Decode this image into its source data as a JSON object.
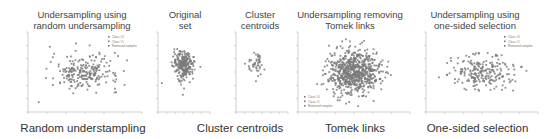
{
  "figure": {
    "panels": [
      {
        "id": "random",
        "title_line1": "Undersampling using",
        "title_line2": "random undersampling",
        "caption": "Random understampling"
      },
      {
        "id": "original",
        "title_line1": "Original",
        "title_line2": "set",
        "caption": ""
      },
      {
        "id": "centroids",
        "title_line1": "Cluster",
        "title_line2": "centroids",
        "caption": "Cluster centroids"
      },
      {
        "id": "tomek",
        "title_line1": "Undersampling removing",
        "title_line2": "Tomek links",
        "caption": "Tomek links"
      },
      {
        "id": "onesided",
        "title_line1": "Undersampling using",
        "title_line2": "one-sided selection",
        "caption": "One-sided selection"
      }
    ],
    "legend": [
      "Class #0",
      "Class #1",
      "Removed samples"
    ],
    "colors": {
      "points": "#7a7a7a",
      "axis": "#bbbbbb",
      "text": "#444444"
    }
  },
  "chart_data": [
    {
      "type": "scatter",
      "title": "Undersampling using random undersampling",
      "caption": "Random understampling",
      "legend": [
        "Class #0",
        "Class #1",
        "Removed samples"
      ],
      "legend_position": "upper right",
      "xlim": [
        -6,
        6
      ],
      "ylim": [
        -6,
        4
      ],
      "n_points_approx": 230,
      "center": [
        0,
        -1
      ],
      "spread": [
        3,
        1.2
      ]
    },
    {
      "type": "scatter",
      "title": "Original set",
      "xlim": [
        -3,
        3
      ],
      "ylim": [
        -6,
        4
      ],
      "n_points_approx": 250,
      "center": [
        0,
        -0.2
      ],
      "spread": [
        1,
        1
      ]
    },
    {
      "type": "scatter",
      "title": "Cluster centroids",
      "caption": "Cluster centroids",
      "xlim": [
        -3,
        3
      ],
      "ylim": [
        -6,
        4
      ],
      "n_points_approx": 45,
      "center": [
        -0.8,
        0
      ],
      "spread": [
        0.8,
        1
      ]
    },
    {
      "type": "scatter",
      "title": "Undersampling removing Tomek links",
      "caption": "Tomek links",
      "legend": [
        "Class #0",
        "Class #1",
        "Removed samples"
      ],
      "legend_position": "lower left",
      "xlim": [
        -8,
        8
      ],
      "ylim": [
        -6,
        6
      ],
      "n_points_approx": 700,
      "center": [
        0,
        0
      ],
      "spread": [
        3,
        1.8
      ]
    },
    {
      "type": "scatter",
      "title": "Undersampling using one-sided selection",
      "caption": "One-sided selection",
      "legend": [
        "Class #0",
        "Class #1",
        "Removed samples"
      ],
      "legend_position": "upper right",
      "xlim": [
        -6,
        6
      ],
      "ylim": [
        -6,
        4
      ],
      "n_points_approx": 220,
      "center": [
        0,
        -1
      ],
      "spread": [
        3,
        1.2
      ]
    }
  ]
}
